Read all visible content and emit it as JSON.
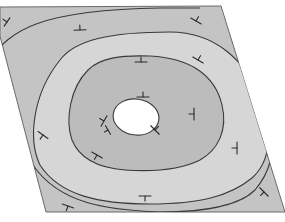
{
  "diagram": {
    "title": "",
    "colors": {
      "background": "#ffffff",
      "outer_band": "#c4c4c4",
      "middle_band": "#d6d6d6",
      "inner_band": "#bcbcbc",
      "core": "#ffffff",
      "line": "#3a3a3a"
    },
    "bands": [
      {
        "name": "outer-band",
        "color": "#c4c4c4"
      },
      {
        "name": "middle-band",
        "color": "#d6d6d6"
      },
      {
        "name": "inner-band",
        "color": "#bcbcbc"
      },
      {
        "name": "core",
        "color": "#ffffff"
      }
    ],
    "symbols": {
      "type": "T-shaped strike/dip tick",
      "count": 16
    }
  }
}
